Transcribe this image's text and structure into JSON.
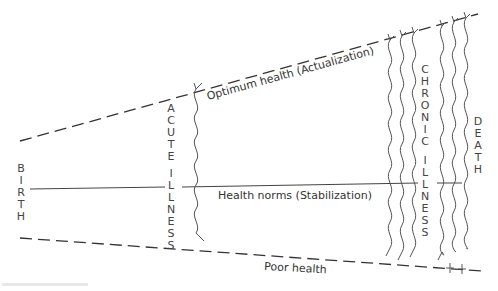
{
  "diagram": {
    "type": "health-illness continuum",
    "labels": {
      "top_line": "Optimum health (Actualization)",
      "middle_line": "Health norms (Stabilization)",
      "bottom_line": "Poor health",
      "start": "BIRTH",
      "acute": "ACUTE ILLNESS",
      "chronic": "CHRONIC ILLNESS",
      "end": "DEATH"
    },
    "vertical": {
      "birth": "B\nI\nR\nT\nH",
      "acute_1": "A\nC\nU\nT\nE",
      "acute_2": "I\nL\nL\nN\nE\nS\nS",
      "chronic_1": "C\nH\nR\nO\nN\nI\nC",
      "chronic_2": "I\nL\nL\nN\nE\nS\nS",
      "death": "D\nE\nA\nT\nH"
    },
    "colors": {
      "line": "#333333",
      "text": "#444444",
      "background": "#ffffff"
    }
  }
}
